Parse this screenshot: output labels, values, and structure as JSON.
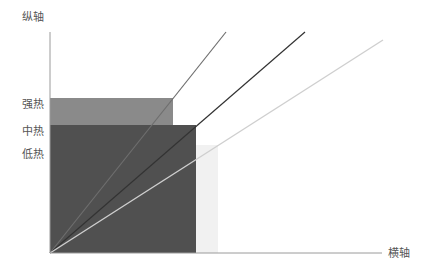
{
  "axes": {
    "y_label": "纵轴",
    "x_label": "横轴",
    "color": "#9a9a9a",
    "origin": [
      50,
      253
    ],
    "y_top": 32,
    "x_right": 382
  },
  "levels": [
    {
      "name": "strong-heat",
      "label": "强热",
      "label_y": 99,
      "x0": 50,
      "x1": 173,
      "y_top": 98,
      "y_bottom": 253,
      "color": "#8a8a8a"
    },
    {
      "name": "medium-heat",
      "label": "中热",
      "label_y": 126,
      "x0": 50,
      "x1": 196,
      "y_top": 125,
      "y_bottom": 253,
      "color": "#505050"
    },
    {
      "name": "low-heat",
      "label": "低热",
      "label_y": 149,
      "x0": 50,
      "x1": 218,
      "y_top": 145,
      "y_bottom": 253,
      "color": "#f1f1f1"
    }
  ],
  "lines": [
    {
      "name": "line-steep",
      "x1": 50,
      "y1": 253,
      "x2": 226,
      "y2": 32,
      "color": "#6e6e6e",
      "width": 1.2
    },
    {
      "name": "line-middle",
      "x1": 50,
      "y1": 253,
      "x2": 305,
      "y2": 32,
      "color": "#333333",
      "width": 1.2
    },
    {
      "name": "line-shallow",
      "x1": 50,
      "y1": 253,
      "x2": 383,
      "y2": 40,
      "color": "#cfcfcf",
      "width": 1.4
    }
  ]
}
